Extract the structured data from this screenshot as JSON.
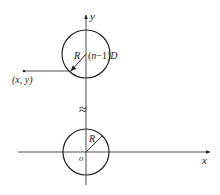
{
  "diagram": {
    "axes": {
      "x_label": "x",
      "y_label": "y",
      "origin_label": "o"
    },
    "upper_circle": {
      "radius_label": "R",
      "center_label_prefix": "(",
      "center_label_n": "n",
      "center_label_mid": "−1)",
      "center_label_suffix": "D"
    },
    "lower_circle": {
      "radius_label": "R"
    },
    "point": {
      "label": "(x, y)"
    },
    "break_symbol": "≈",
    "colors": {
      "stroke": "#222222",
      "background": "#ffffff"
    }
  }
}
